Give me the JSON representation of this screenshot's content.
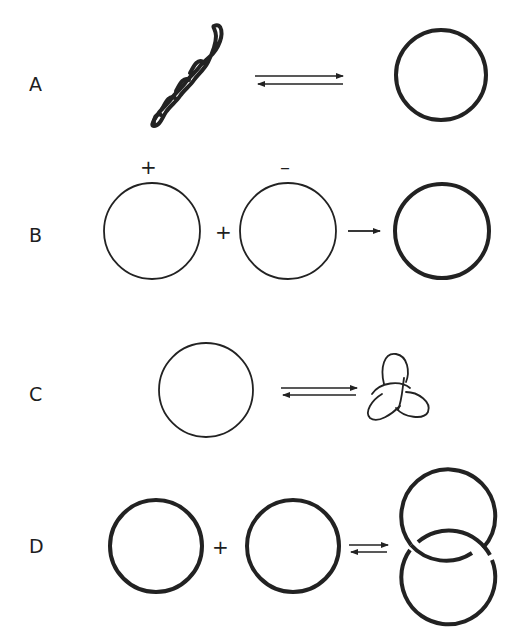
{
  "figure": {
    "ink_color": "#222222",
    "background": "#ffffff",
    "panels": [
      {
        "id": "A",
        "label": "A",
        "left": "supercoiled DNA (twisted)",
        "arrow": "equilibrium (double half-arrows)",
        "right": "relaxed circle (thick)"
      },
      {
        "id": "B",
        "label": "B",
        "left_sign": "+",
        "middle_sign": "–",
        "plus": "+",
        "left": "circle (thin, positive supercoiling)",
        "middle": "circle (thin, negative supercoiling)",
        "arrow": "forward arrow",
        "right": "relaxed circle (thick)"
      },
      {
        "id": "C",
        "label": "C",
        "left": "circle (thin)",
        "arrow": "equilibrium (double half-arrows)",
        "right": "trefoil knot"
      },
      {
        "id": "D",
        "label": "D",
        "plus": "+",
        "left": "circle (thick)",
        "middle": "circle (thick)",
        "arrow": "equilibrium (double half-arrows)",
        "right": "catenane (two interlocked circles)"
      }
    ]
  }
}
